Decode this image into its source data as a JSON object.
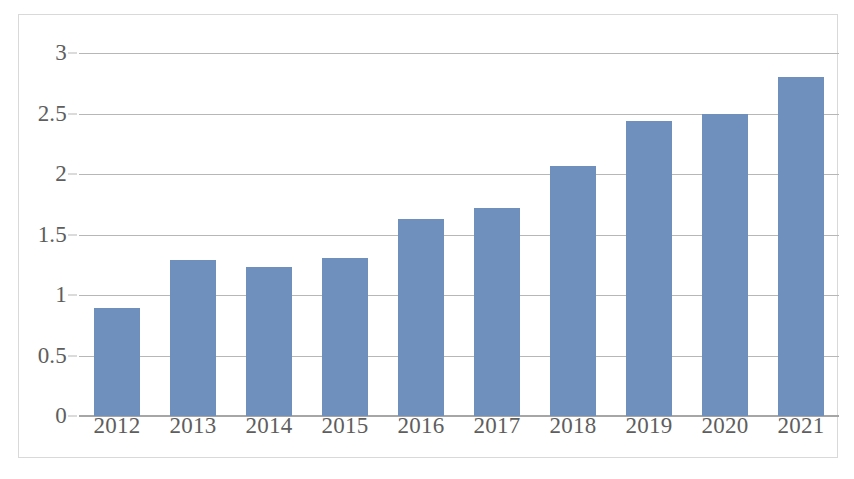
{
  "chart_data": {
    "type": "bar",
    "title": "",
    "subtitle": "",
    "xlabel": "",
    "ylabel": "",
    "categories": [
      "2012",
      "2013",
      "2014",
      "2015",
      "2016",
      "2017",
      "2018",
      "2019",
      "2020",
      "2021"
    ],
    "values": [
      0.89,
      1.29,
      1.23,
      1.31,
      1.63,
      1.72,
      2.07,
      2.44,
      2.5,
      2.8
    ],
    "ylim": [
      0,
      3
    ],
    "ytick_values": [
      0,
      0.5,
      1,
      1.5,
      2,
      2.5,
      3
    ],
    "ytick_labels": [
      "0",
      "0.5",
      "1",
      "1.5",
      "2",
      "2.5",
      "3"
    ],
    "grid": true,
    "grid_axis": "y",
    "legend": false,
    "legend_position": "none",
    "series": [
      {
        "name": "",
        "values": [
          0.89,
          1.29,
          1.23,
          1.31,
          1.63,
          1.72,
          2.07,
          2.44,
          2.5,
          2.8
        ]
      }
    ],
    "annotations": []
  },
  "colors": {
    "bar_fill": "#6f8fbd",
    "gridline": "#b7b7b7",
    "baseline": "#a6a6a6",
    "axis_text": "#5e5e5e",
    "frame_border": "#d9d9d9",
    "plot_background": "#ffffff"
  }
}
